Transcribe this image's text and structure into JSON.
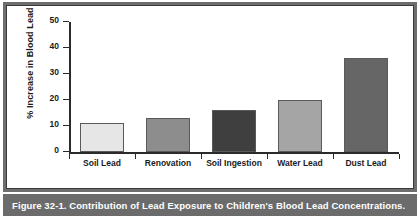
{
  "figure": {
    "caption": "Figure 32-1. Contribution of Lead Exposure to Children's Blood Lead Concentrations."
  },
  "chart_data": {
    "type": "bar",
    "title": "",
    "xlabel": "",
    "ylabel": "% Increase in Blood Lead",
    "categories": [
      "Soil Lead",
      "Renovation",
      "Soil Ingestion",
      "Water Lead",
      "Dust Lead"
    ],
    "values": [
      11,
      13,
      16,
      20,
      36
    ],
    "bar_colors": [
      "#e6e6e6",
      "#8d8d8d",
      "#3f3f3f",
      "#a5a5a5",
      "#666666"
    ],
    "ylim": [
      0,
      50
    ],
    "yticks": [
      0,
      10,
      20,
      30,
      40,
      50
    ],
    "ytick_labels": [
      "0",
      "10",
      "20",
      "30",
      "40",
      "50"
    ],
    "grid": false,
    "legend": null
  },
  "style": {
    "axis_color": "#2b2b2b",
    "frame_color": "#6e6e6e",
    "caption_background": "#6b6b6b",
    "caption_text_color": "#ffffff",
    "plot_background": "#ffffff"
  }
}
